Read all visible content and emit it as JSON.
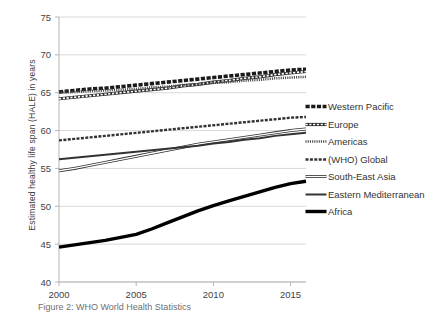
{
  "chart_data": {
    "type": "line",
    "title": "",
    "xlabel": "",
    "ylabel": "Estimated healthy life span (HALE) in years",
    "xlim": [
      2000,
      2016
    ],
    "ylim": [
      40,
      75
    ],
    "yticks": [
      40,
      45,
      50,
      55,
      60,
      65,
      70,
      75
    ],
    "xticks": [
      2000,
      2005,
      2010,
      2015
    ],
    "grid": "horizontal",
    "legend_position": "right",
    "x": [
      2000,
      2001,
      2002,
      2003,
      2004,
      2005,
      2006,
      2007,
      2008,
      2009,
      2010,
      2011,
      2012,
      2013,
      2014,
      2015,
      2016
    ],
    "series": [
      {
        "name": "Western Pacific",
        "style": "thick-dashed-black",
        "color": "#1a1a1a",
        "values": [
          65.1,
          65.3,
          65.5,
          65.6,
          65.8,
          66.0,
          66.2,
          66.4,
          66.6,
          66.8,
          67.0,
          67.2,
          67.4,
          67.6,
          67.8,
          68.0,
          68.1
        ]
      },
      {
        "name": "Europe",
        "style": "hatched-outline",
        "color": "#2b2b2b",
        "values": [
          64.2,
          64.4,
          64.6,
          64.8,
          65.0,
          65.2,
          65.4,
          65.6,
          65.9,
          66.1,
          66.4,
          66.6,
          66.9,
          67.1,
          67.4,
          67.6,
          67.8
        ]
      },
      {
        "name": "Americas",
        "style": "fine-dotted",
        "color": "#4a4a4a",
        "values": [
          65.0,
          65.1,
          65.2,
          65.3,
          65.4,
          65.5,
          65.7,
          65.8,
          66.0,
          66.1,
          66.3,
          66.4,
          66.6,
          66.7,
          66.9,
          67.0,
          67.1
        ]
      },
      {
        "name": "(WHO) Global",
        "style": "dashed-thin",
        "color": "#333333",
        "values": [
          58.7,
          58.9,
          59.1,
          59.3,
          59.5,
          59.7,
          59.9,
          60.1,
          60.3,
          60.5,
          60.7,
          60.9,
          61.1,
          61.3,
          61.5,
          61.7,
          61.8
        ]
      },
      {
        "name": "South-East Asia",
        "style": "open-outline",
        "color": "#2e2e2e",
        "values": [
          54.7,
          55.0,
          55.4,
          55.8,
          56.2,
          56.6,
          57.0,
          57.4,
          57.8,
          58.2,
          58.5,
          58.8,
          59.1,
          59.4,
          59.7,
          60.0,
          60.2
        ]
      },
      {
        "name": "Eastern Mediterranean",
        "style": "solid-medium",
        "color": "#333333",
        "values": [
          56.2,
          56.4,
          56.6,
          56.8,
          57.0,
          57.2,
          57.4,
          57.6,
          57.8,
          58.0,
          58.3,
          58.5,
          58.8,
          59.0,
          59.3,
          59.5,
          59.7
        ]
      },
      {
        "name": "Africa",
        "style": "solid-thick",
        "color": "#000000",
        "values": [
          44.6,
          44.9,
          45.2,
          45.5,
          45.9,
          46.3,
          47.0,
          47.8,
          48.6,
          49.4,
          50.1,
          50.7,
          51.3,
          51.9,
          52.5,
          53.0,
          53.3
        ]
      }
    ]
  },
  "axis": {
    "y_title": "Estimated healthy life span (HALE) in years",
    "y_tick_labels": [
      "75",
      "70",
      "65",
      "60",
      "55",
      "50",
      "45",
      "40"
    ],
    "x_tick_labels": [
      "2000",
      "2005",
      "2010",
      "2015"
    ]
  },
  "legend": {
    "items": [
      {
        "label": "Western Pacific",
        "swatch": "thick-dashed-black"
      },
      {
        "label": "Europe",
        "swatch": "hatched-outline"
      },
      {
        "label": "Americas",
        "swatch": "fine-dotted"
      },
      {
        "label": "(WHO) Global",
        "swatch": "dashed-thin"
      },
      {
        "label": "South-East Asia",
        "swatch": "open-outline"
      },
      {
        "label": "Eastern Mediterranean",
        "swatch": "solid-medium"
      },
      {
        "label": "Africa",
        "swatch": "solid-thick"
      }
    ]
  },
  "caption": {
    "text": "Figure 2: WHO World Health Statistics"
  }
}
